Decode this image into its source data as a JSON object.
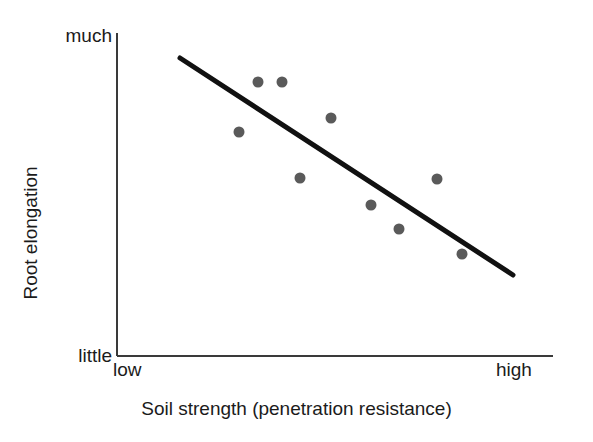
{
  "chart_data": {
    "type": "scatter",
    "title": "",
    "xlabel": "Soil strength (penetration resistance)",
    "ylabel": "Root elongation",
    "x_tick_labels": [
      "low",
      "high"
    ],
    "y_tick_labels": [
      "little",
      "much"
    ],
    "xlim": [
      0,
      1
    ],
    "ylim": [
      0,
      1
    ],
    "grid": false,
    "legend": "none",
    "axis_style": "left-and-bottom-spine",
    "point_color": "#5a5a5a",
    "line_color": "#111111",
    "axis_color": "#3a3a3a",
    "point_radius_px": 5.5,
    "line_width_px": 5,
    "points": [
      {
        "x": 0.28,
        "y": 0.85
      },
      {
        "x": 0.32,
        "y": 0.85
      },
      {
        "x": 0.28,
        "y": 0.69
      },
      {
        "x": 0.49,
        "y": 0.74
      },
      {
        "x": 0.42,
        "y": 0.55
      },
      {
        "x": 0.58,
        "y": 0.47
      },
      {
        "x": 0.65,
        "y": 0.39
      },
      {
        "x": 0.73,
        "y": 0.55
      },
      {
        "x": 0.79,
        "y": 0.32
      }
    ],
    "points_px": [
      {
        "cx": 258,
        "cy": 82
      },
      {
        "cx": 282,
        "cy": 82
      },
      {
        "cx": 239,
        "cy": 132
      },
      {
        "cx": 331,
        "cy": 118
      },
      {
        "cx": 300,
        "cy": 178
      },
      {
        "cx": 371,
        "cy": 205
      },
      {
        "cx": 399,
        "cy": 229
      },
      {
        "cx": 437,
        "cy": 179
      },
      {
        "cx": 462,
        "cy": 254
      }
    ],
    "trend_line_px": {
      "x1": 180,
      "y1": 58,
      "x2": 513,
      "y2": 275
    },
    "trend_line": {
      "x1": 0.145,
      "y1": 0.92,
      "x2": 0.91,
      "y2": 0.25
    },
    "axes_px": {
      "y_axis_x": 117,
      "y_axis_top": 33,
      "y_axis_bottom": 356,
      "x_axis_y": 356,
      "x_axis_left": 117,
      "x_axis_right": 553
    }
  },
  "labels": {
    "y_top": "much",
    "y_bottom": "little",
    "x_left": "low",
    "x_right": "high",
    "y_title": "Root elongation",
    "x_title": "Soil strength (penetration resistance)"
  }
}
